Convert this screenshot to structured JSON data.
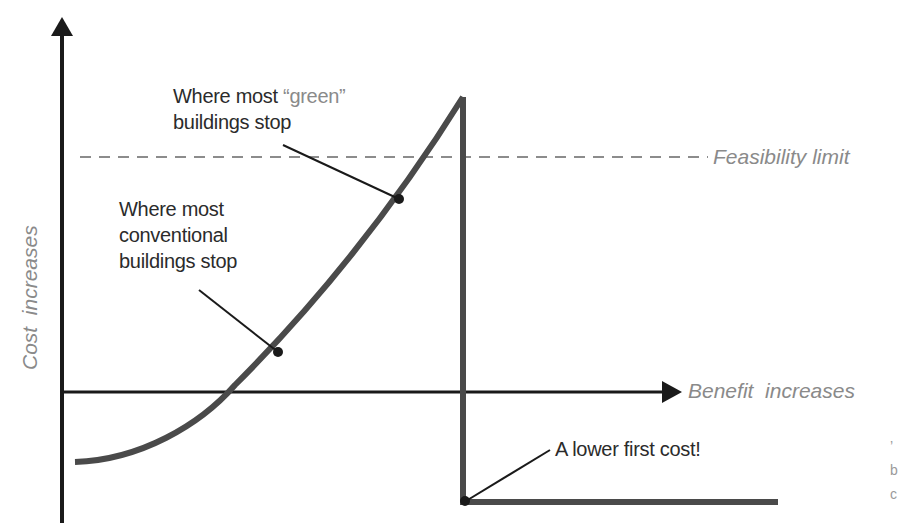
{
  "diagram": {
    "type": "cost-benefit curve",
    "y_axis_label": "Cost  increases",
    "x_axis_label": "Benefit  increases",
    "feasibility_label": "Feasibility limit",
    "annotations": {
      "green": {
        "line1_prefix": "Where most",
        "line1_quoted": "“green”",
        "line2": "buildings stop"
      },
      "conventional": {
        "line1": "Where most",
        "line2": "conventional",
        "line3": "buildings stop"
      },
      "lower_cost": {
        "text": "A lower first cost!"
      }
    },
    "cut_off_text": [
      "’",
      "b",
      "c"
    ],
    "colors": {
      "axis": "#1a1a1a",
      "curve": "#4a4a4a",
      "dashed_line": "#8c8c8c",
      "label_text": "#2b2b2b",
      "axis_label_text": "#8a8a8a"
    }
  }
}
